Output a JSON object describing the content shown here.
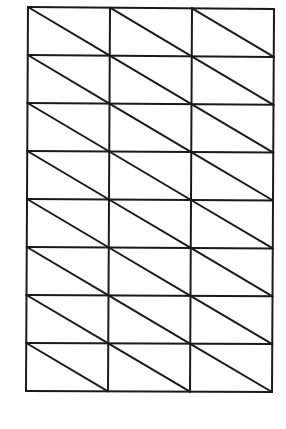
{
  "diagram": {
    "type": "triangulated-grid-mesh",
    "columns": 3,
    "rows": 8,
    "diagonal_direction": "top-left-to-bottom-right",
    "line_color": "#1a1a1a",
    "background_color": "#ffffff",
    "corners": {
      "top_left": [
        28,
        7
      ],
      "top_right": [
        274,
        9
      ],
      "bottom_left": [
        26,
        391
      ],
      "bottom_right": [
        272,
        392
      ]
    }
  }
}
